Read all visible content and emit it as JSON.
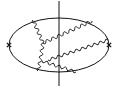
{
  "diagram": {
    "type": "feynman-diagram",
    "background": "#ffffff",
    "stroke": "#111111",
    "ellipse": {
      "cx": 59,
      "cy": 45,
      "rx": 50,
      "ry": 27
    },
    "cut_line": {
      "x": 59,
      "y1": 1,
      "y2": 86
    },
    "vertices": [
      {
        "name": "left-cross",
        "x": 9,
        "y": 45
      },
      {
        "name": "right-cross",
        "x": 109,
        "y": 45
      }
    ],
    "wavy_lines": [
      {
        "name": "gluon-left-upper",
        "from": [
          33,
          20
        ],
        "to": [
          43,
          43
        ]
      },
      {
        "name": "gluon-left-lower",
        "from": [
          43,
          43
        ],
        "to": [
          40,
          62
        ]
      },
      {
        "name": "gluon-left-bottom",
        "from": [
          40,
          62
        ],
        "to": [
          38,
          71
        ]
      },
      {
        "name": "gluon-upper-diagonal",
        "from": [
          43,
          43
        ],
        "to": [
          92,
          21
        ]
      },
      {
        "name": "gluon-middle-diagonal",
        "from": [
          48,
          60
        ],
        "to": [
          108,
          40
        ]
      },
      {
        "name": "gluon-lower",
        "from": [
          42,
          61
        ],
        "to": [
          76,
          72
        ]
      }
    ]
  }
}
